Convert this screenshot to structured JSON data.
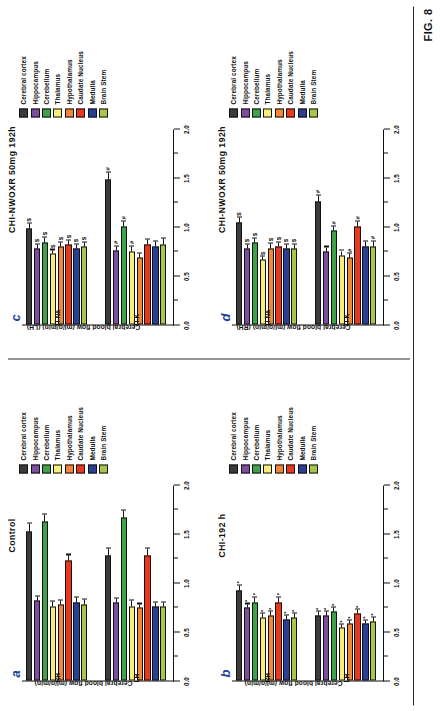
{
  "figure": {
    "label": "FIG. 8",
    "y_axis_label_lh": "Cerebral blood flow (ml/g/min) (LH)",
    "y_axis_label_rh": "Cerebral blood flow (ml/g/min) (RH)",
    "y_axis_label_plain": "Cerebral blood flow (ml/g/min)",
    "ticks": [
      "0.0",
      "0.5",
      "1.0",
      "1.5",
      "2.0"
    ],
    "tick_values": [
      0.0,
      0.5,
      1.0,
      1.5,
      2.0
    ],
    "ylim": [
      0.0,
      2.0
    ]
  },
  "legend": {
    "position": "right",
    "items": [
      {
        "label": "Cerebral cortex",
        "color": "#3b3b3b"
      },
      {
        "label": "Hippocampus",
        "color": "#7b4f9d"
      },
      {
        "label": "Cerebellum",
        "color": "#3fa24a"
      },
      {
        "label": "Thalamus",
        "color": "#f6f07a"
      },
      {
        "label": "Hypothalamus",
        "color": "#f0883a"
      },
      {
        "label": "Caudate Nucleus",
        "color": "#e8391c"
      },
      {
        "label": "Medulla",
        "color": "#2b3f91"
      },
      {
        "label": "Brain Stem",
        "color": "#a9c64a"
      }
    ]
  },
  "chart_data": [
    {
      "panel": "a",
      "type": "bar",
      "title": "Control",
      "ylabel": "Cerebral blood flow (ml/g/min)",
      "xlabel": "",
      "ylim": [
        0.0,
        2.0
      ],
      "grid": false,
      "categories": [
        "Cerebral cortex",
        "Hippocampus",
        "Cerebellum",
        "Thalamus",
        "Hypothalamus",
        "Caudate Nucleus",
        "Medulla",
        "Brain Stem"
      ],
      "groups": [
        "RH",
        "LH"
      ],
      "series": [
        {
          "name": "RH",
          "values": [
            1.52,
            0.82,
            1.62,
            0.76,
            0.78,
            1.22,
            0.8,
            0.78
          ],
          "errors": [
            0.08,
            0.04,
            0.07,
            0.05,
            0.04,
            0.06,
            0.05,
            0.05
          ],
          "sig": [
            "",
            "",
            "",
            "",
            "",
            "",
            "",
            ""
          ]
        },
        {
          "name": "LH",
          "values": [
            1.28,
            0.8,
            1.66,
            0.76,
            0.74,
            1.28,
            0.76,
            0.76
          ],
          "errors": [
            0.07,
            0.04,
            0.07,
            0.06,
            0.04,
            0.07,
            0.04,
            0.04
          ],
          "sig": [
            "",
            "",
            "",
            "",
            "",
            "",
            "",
            ""
          ]
        }
      ]
    },
    {
      "panel": "b",
      "type": "bar",
      "title": "CHI-192 h",
      "ylabel": "Cerebral blood flow (ml/g/min)",
      "xlabel": "",
      "ylim": [
        0.0,
        2.0
      ],
      "grid": false,
      "categories": [
        "Cerebral cortex",
        "Hippocampus",
        "Cerebellum",
        "Thalamus",
        "Hypothalamus",
        "Caudate Nucleus",
        "Medulla",
        "Brain Stem"
      ],
      "groups": [
        "RH",
        "LH"
      ],
      "series": [
        {
          "name": "RH",
          "values": [
            0.92,
            0.74,
            0.8,
            0.64,
            0.66,
            0.8,
            0.62,
            0.64
          ],
          "errors": [
            0.05,
            0.04,
            0.05,
            0.04,
            0.04,
            0.05,
            0.04,
            0.04
          ],
          "sig": [
            "*",
            "*",
            "*",
            "*",
            "*",
            "*",
            "*",
            "*"
          ]
        },
        {
          "name": "LH",
          "values": [
            0.66,
            0.66,
            0.7,
            0.54,
            0.58,
            0.68,
            0.58,
            0.6
          ],
          "errors": [
            0.04,
            0.04,
            0.04,
            0.03,
            0.03,
            0.04,
            0.03,
            0.04
          ],
          "sig": [
            "*",
            "*",
            "*",
            "*",
            "*",
            "*",
            "*",
            "*"
          ]
        }
      ]
    },
    {
      "panel": "c",
      "type": "bar",
      "title": "CHI-NWOXR 50mg 192h",
      "ylabel": "Cerebral blood flow (ml/g/min) (LH)",
      "xlabel": "",
      "ylim": [
        0.0,
        2.0
      ],
      "grid": false,
      "categories": [
        "Cerebral cortex",
        "Hippocampus",
        "Cerebellum",
        "Thalamus",
        "Hypothalamus",
        "Caudate Nucleus",
        "Medulla",
        "Brain Stem"
      ],
      "groups": [
        "TI-Na",
        "TI-K"
      ],
      "series": [
        {
          "name": "TI-Na",
          "values": [
            0.98,
            0.78,
            0.84,
            0.72,
            0.8,
            0.82,
            0.78,
            0.8
          ],
          "errors": [
            0.05,
            0.04,
            0.05,
            0.04,
            0.04,
            0.04,
            0.04,
            0.04
          ],
          "sig": [
            "$",
            "$",
            "$",
            "$",
            "$",
            "$",
            "$",
            "$"
          ]
        },
        {
          "name": "TI-K",
          "values": [
            1.48,
            0.76,
            1.0,
            0.74,
            0.68,
            0.82,
            0.8,
            0.82
          ],
          "errors": [
            0.07,
            0.04,
            0.05,
            0.06,
            0.04,
            0.05,
            0.05,
            0.06
          ],
          "sig": [
            "#",
            "#",
            "#",
            "#",
            "",
            "",
            "",
            ""
          ]
        }
      ]
    },
    {
      "panel": "d",
      "type": "bar",
      "title": "CHI-NWOXR 50mg 192h",
      "ylabel": "Cerebral blood flow (ml/g/min) (RH)",
      "xlabel": "",
      "ylim": [
        0.0,
        2.0
      ],
      "grid": false,
      "categories": [
        "Cerebral cortex",
        "Hippocampus",
        "Cerebellum",
        "Thalamus",
        "Hypothalamus",
        "Caudate Nucleus",
        "Medulla",
        "Brain Stem"
      ],
      "groups": [
        "TI-Na",
        "TI-K"
      ],
      "series": [
        {
          "name": "TI-Na",
          "values": [
            1.04,
            0.78,
            0.84,
            0.66,
            0.78,
            0.8,
            0.78,
            0.78
          ],
          "errors": [
            0.05,
            0.04,
            0.04,
            0.03,
            0.05,
            0.04,
            0.04,
            0.04
          ],
          "sig": [
            "$",
            "$",
            "$",
            "$",
            "$",
            "$",
            "$",
            "$"
          ]
        },
        {
          "name": "TI-K",
          "values": [
            1.26,
            0.74,
            0.96,
            0.7,
            0.68,
            1.0,
            0.8,
            0.8
          ],
          "errors": [
            0.06,
            0.05,
            0.04,
            0.05,
            0.04,
            0.05,
            0.05,
            0.05
          ],
          "sig": [
            "#",
            "",
            "#",
            "",
            "#",
            "#",
            "",
            "#"
          ]
        }
      ]
    }
  ]
}
